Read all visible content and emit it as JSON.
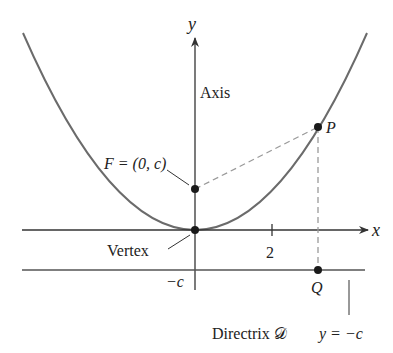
{
  "diagram": {
    "axes": {
      "x_label": "x",
      "y_label": "y",
      "x_tick_label": "2",
      "neg_c_label": "−c"
    },
    "labels": {
      "axis": "Axis",
      "focus": "F = (0, c)",
      "vertex": "Vertex",
      "point_p": "P",
      "point_q": "Q",
      "directrix_name": "Directrix 𝒟",
      "directrix_eq": "y = −c"
    },
    "colors": {
      "curve": "#6b6b6b",
      "axes": "#333333",
      "dashed": "#9a9a9a",
      "points": "#1a1a1a",
      "text": "#222222"
    }
  }
}
